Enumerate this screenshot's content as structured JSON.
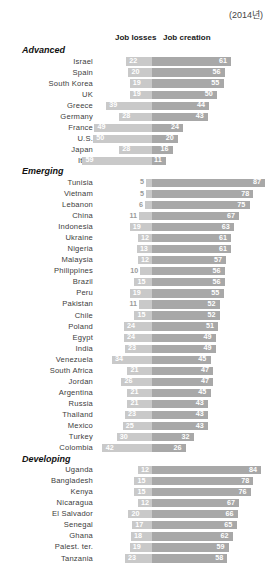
{
  "year_note": "(2014년)",
  "headers": {
    "loss": "Job losses",
    "creation": "Job creation"
  },
  "chart_data": {
    "type": "bar",
    "orientation": "horizontal",
    "subtype": "diverging-bidirectional",
    "title": "",
    "subtitle": "(2014년)",
    "xlabel": "",
    "ylabel": "",
    "legend": [
      "Job losses",
      "Job creation"
    ],
    "legend_position": "top",
    "grid": false,
    "series": [
      {
        "name": "Job losses",
        "color": "#c9c9c9",
        "direction": "left"
      },
      {
        "name": "Job creation",
        "color": "#a8a8a8",
        "direction": "right"
      }
    ],
    "groups": [
      {
        "name": "Advanced",
        "rows": [
          {
            "label": "Israel",
            "loss": 22,
            "creation": 61
          },
          {
            "label": "Spain",
            "loss": 20,
            "creation": 56
          },
          {
            "label": "South Korea",
            "loss": 19,
            "creation": 55
          },
          {
            "label": "UK",
            "loss": 19,
            "creation": 50
          },
          {
            "label": "Greece",
            "loss": 39,
            "creation": 44
          },
          {
            "label": "Germany",
            "loss": 28,
            "creation": 43
          },
          {
            "label": "France",
            "loss": 49,
            "creation": 24
          },
          {
            "label": "U.S.",
            "loss": 50,
            "creation": 20
          },
          {
            "label": "Japan",
            "loss": 28,
            "creation": 16
          },
          {
            "label": "Italy",
            "loss": 59,
            "creation": 11
          }
        ]
      },
      {
        "name": "Emerging",
        "rows": [
          {
            "label": "Tunisia",
            "loss": 5,
            "creation": 87
          },
          {
            "label": "Vietnam",
            "loss": 5,
            "creation": 78
          },
          {
            "label": "Lebanon",
            "loss": 6,
            "creation": 75
          },
          {
            "label": "China",
            "loss": 11,
            "creation": 67
          },
          {
            "label": "Indonesia",
            "loss": 19,
            "creation": 63
          },
          {
            "label": "Ukraine",
            "loss": 12,
            "creation": 61
          },
          {
            "label": "Nigeria",
            "loss": 13,
            "creation": 61
          },
          {
            "label": "Malaysia",
            "loss": 12,
            "creation": 57
          },
          {
            "label": "Philippines",
            "loss": 10,
            "creation": 56
          },
          {
            "label": "Brazil",
            "loss": 15,
            "creation": 56
          },
          {
            "label": "Peru",
            "loss": 19,
            "creation": 55
          },
          {
            "label": "Pakistan",
            "loss": 11,
            "creation": 52
          },
          {
            "label": "Chile",
            "loss": 15,
            "creation": 52
          },
          {
            "label": "Poland",
            "loss": 24,
            "creation": 51
          },
          {
            "label": "Egypt",
            "loss": 24,
            "creation": 49
          },
          {
            "label": "India",
            "loss": 23,
            "creation": 49
          },
          {
            "label": "Venezuela",
            "loss": 34,
            "creation": 45
          },
          {
            "label": "South Africa",
            "loss": 21,
            "creation": 47
          },
          {
            "label": "Jordan",
            "loss": 26,
            "creation": 47
          },
          {
            "label": "Argentina",
            "loss": 21,
            "creation": 45
          },
          {
            "label": "Russia",
            "loss": 21,
            "creation": 43
          },
          {
            "label": "Thailand",
            "loss": 23,
            "creation": 43
          },
          {
            "label": "Mexico",
            "loss": 25,
            "creation": 43
          },
          {
            "label": "Turkey",
            "loss": 30,
            "creation": 32
          },
          {
            "label": "Colombia",
            "loss": 42,
            "creation": 26
          }
        ]
      },
      {
        "name": "Developing",
        "rows": [
          {
            "label": "Uganda",
            "loss": 12,
            "creation": 84
          },
          {
            "label": "Bangladesh",
            "loss": 15,
            "creation": 78
          },
          {
            "label": "Kenya",
            "loss": 15,
            "creation": 76
          },
          {
            "label": "Nicaragua",
            "loss": 12,
            "creation": 67
          },
          {
            "label": "El Salvador",
            "loss": 20,
            "creation": 66
          },
          {
            "label": "Senegal",
            "loss": 17,
            "creation": 65
          },
          {
            "label": "Ghana",
            "loss": 18,
            "creation": 62
          },
          {
            "label": "Palest. ter.",
            "loss": 19,
            "creation": 59
          },
          {
            "label": "Tanzania",
            "loss": 23,
            "creation": 58
          }
        ]
      }
    ]
  }
}
